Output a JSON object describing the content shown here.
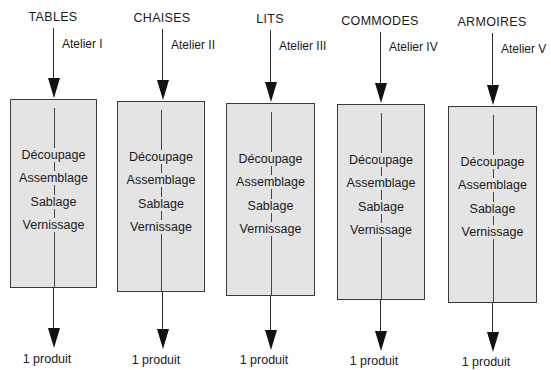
{
  "diagram": {
    "type": "workshop-flow",
    "columns": [
      {
        "product_type": "TABLES",
        "workshop": "Atelier I",
        "steps": [
          "Découpage",
          "Assemblage",
          "Sablage",
          "Vernissage"
        ],
        "output": "1 produit"
      },
      {
        "product_type": "CHAISES",
        "workshop": "Atelier II",
        "steps": [
          "Découpage",
          "Assemblage",
          "Sablage",
          "Vernissage"
        ],
        "output": "1 produit"
      },
      {
        "product_type": "LITS",
        "workshop": "Atelier III",
        "steps": [
          "Découpage",
          "Assemblage",
          "Sablage",
          "Vernissage"
        ],
        "output": "1 produit"
      },
      {
        "product_type": "COMMODES",
        "workshop": "Atelier IV",
        "steps": [
          "Découpage",
          "Assemblage",
          "Sablage",
          "Vernissage"
        ],
        "output": "1 produit"
      },
      {
        "product_type": "ARMOIRES",
        "workshop": "Atelier V",
        "steps": [
          "Découpage",
          "Assemblage",
          "Sablage",
          "Vernissage"
        ],
        "output": "1 produit"
      }
    ],
    "colors": {
      "box_fill": "#e4e4e4",
      "line": "#1a1a1a"
    }
  }
}
